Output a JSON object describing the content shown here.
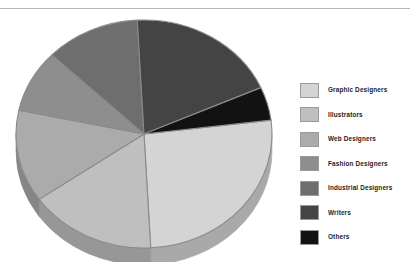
{
  "chart_data": {
    "type": "pie",
    "title": "",
    "legend_position": "right",
    "three_d": true,
    "categories": [
      "Graphic Designers",
      "Illustrators",
      "Web Designers",
      "Fashion Designers",
      "Industrial Designers",
      "Writers",
      "Others"
    ],
    "values": [
      26,
      16,
      13,
      9,
      12,
      19,
      5
    ],
    "units": "percent",
    "colors": [
      "#d4d4d4",
      "#bfbfbf",
      "#ababab",
      "#8e8e8e",
      "#6e6e6e",
      "#444444",
      "#121212"
    ],
    "slices": [
      {
        "label": "Graphic Designers",
        "value": 26,
        "color": "#d4d4d4",
        "start_angle": 353,
        "end_angle": 87,
        "side_color": "#a9a9a9"
      },
      {
        "label": "Illustrators",
        "value": 16,
        "color": "#bfbfbf",
        "start_angle": 87,
        "end_angle": 145,
        "side_color": "#979797"
      },
      {
        "label": "Web Designers",
        "value": 13,
        "color": "#ababab",
        "start_angle": 145,
        "end_angle": 192,
        "side_color": "#868686"
      },
      {
        "label": "Fashion Designers",
        "value": 9,
        "color": "#8e8e8e",
        "start_angle": 192,
        "end_angle": 224,
        "side_color": "#707070"
      },
      {
        "label": "Industrial Designers",
        "value": 12,
        "color": "#6e6e6e",
        "start_angle": 224,
        "end_angle": 267,
        "side_color": "#555555"
      },
      {
        "label": "Writers",
        "value": 19,
        "color": "#444444",
        "start_angle": 267,
        "end_angle": 336,
        "side_color": "#333333"
      },
      {
        "label": "Others",
        "value": 5,
        "color": "#121212",
        "start_angle": 336,
        "end_angle": 353,
        "side_color": "#0c0c0c"
      }
    ]
  },
  "legend": {
    "items": [
      {
        "label": "Graphic Designers",
        "color": "#d4d4d4"
      },
      {
        "label": "Illustrators",
        "color": "#bfbfbf"
      },
      {
        "label": "Web Designers",
        "color": "#ababab"
      },
      {
        "label": "Fashion Designers",
        "color": "#8e8e8e"
      },
      {
        "label": "Industrial Designers",
        "color": "#6e6e6e"
      },
      {
        "label": "Writers",
        "color": "#444444"
      },
      {
        "label": "Others",
        "color": "#121212"
      }
    ]
  }
}
